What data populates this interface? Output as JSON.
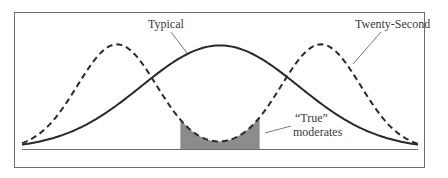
{
  "figure": {
    "colors": {
      "frame": "#6e6e6e",
      "curve": "#2a2a2a",
      "shade": "#8c8c8c",
      "text": "#3a3a3a"
    }
  },
  "chart_data": {
    "type": "line",
    "title": "",
    "xlabel": "",
    "ylabel": "",
    "grid": false,
    "legend": "none",
    "xlim": [
      -1,
      1
    ],
    "ylim": [
      0,
      1
    ],
    "series": [
      {
        "name": "Typical",
        "style": "solid",
        "shape": "unimodal",
        "peaks": [
          {
            "x": 0,
            "y": 0.95
          }
        ],
        "endpoints_y": 0.04
      },
      {
        "name": "Twenty-Second",
        "style": "dashed",
        "shape": "bimodal",
        "peaks": [
          {
            "x": -0.52,
            "y": 0.96
          },
          {
            "x": 0.51,
            "y": 0.96
          }
        ],
        "trough": {
          "x": 0,
          "y": 0.1
        },
        "endpoints_y": 0.01
      }
    ],
    "shaded_region": {
      "label": "“True” moderates",
      "x_range": [
        -0.2,
        0.2
      ],
      "under_series": "Twenty-Second"
    },
    "annotations": [
      {
        "text": "Typical",
        "points_to": "Typical"
      },
      {
        "text": "Twenty-Second",
        "points_to": "Twenty-Second"
      },
      {
        "text_lines": [
          "“True”",
          "moderates"
        ],
        "points_to": "shaded_region"
      }
    ]
  }
}
